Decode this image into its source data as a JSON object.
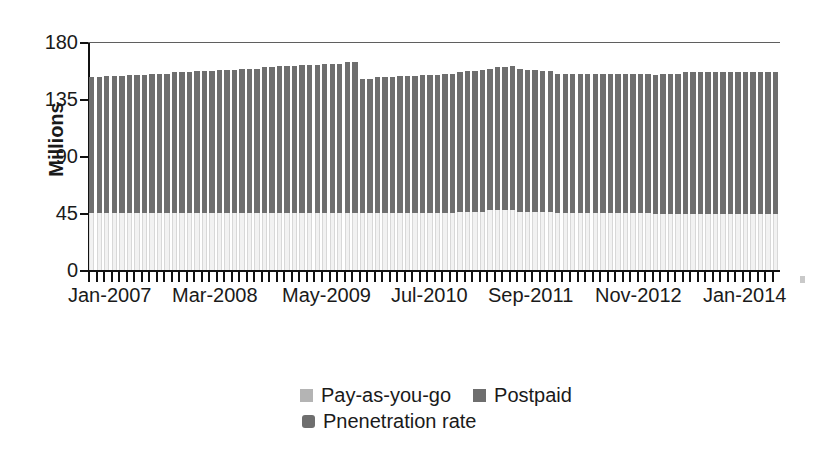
{
  "chart": {
    "type": "bar",
    "ylabel": "Millions",
    "xlabel": "",
    "title": ""
  },
  "axes": {
    "y_ticks": [
      "180",
      "135",
      "90",
      "45",
      "0"
    ],
    "x_ticks": [
      "Jan-2007",
      "Mar-2008",
      "May-2009",
      "Jul-2010",
      "Sep-2011",
      "Nov-2012",
      "Jan-2014"
    ]
  },
  "legend": {
    "items": [
      {
        "label": "Pay-as-you-go",
        "color": "#b4b4b4"
      },
      {
        "label": "Postpaid",
        "color": "#6e6e6e"
      },
      {
        "label": "Pnenetration rate",
        "color": "#6e6e6e"
      }
    ]
  },
  "colors": {
    "postpaid": "#6e6e6e",
    "payg": "#f2f2f2",
    "axis": "#111111",
    "frame": "#5f5f5f",
    "background": "#ffffff"
  },
  "chart_data": {
    "type": "bar",
    "stacked": true,
    "title": "",
    "xlabel": "",
    "ylabel": "Millions",
    "ylim": [
      0,
      180
    ],
    "yticks": [
      0,
      45,
      90,
      135,
      180
    ],
    "grid": false,
    "legend_position": "bottom",
    "categories": [
      "Jan-2007",
      "Feb-2007",
      "Mar-2007",
      "Apr-2007",
      "May-2007",
      "Jun-2007",
      "Jul-2007",
      "Aug-2007",
      "Sep-2007",
      "Oct-2007",
      "Nov-2007",
      "Dec-2007",
      "Jan-2008",
      "Feb-2008",
      "Mar-2008",
      "Apr-2008",
      "May-2008",
      "Jun-2008",
      "Jul-2008",
      "Aug-2008",
      "Sep-2008",
      "Oct-2008",
      "Nov-2008",
      "Dec-2008",
      "Jan-2009",
      "Feb-2009",
      "Mar-2009",
      "Apr-2009",
      "May-2009",
      "Jun-2009",
      "Jul-2009",
      "Aug-2009",
      "Sep-2009",
      "Oct-2009",
      "Nov-2009",
      "Dec-2009",
      "Jan-2010",
      "Feb-2010",
      "Mar-2010",
      "Apr-2010",
      "May-2010",
      "Jun-2010",
      "Jul-2010",
      "Aug-2010",
      "Sep-2010",
      "Oct-2010",
      "Nov-2010",
      "Dec-2010",
      "Jan-2011",
      "Feb-2011",
      "Mar-2011",
      "Apr-2011",
      "May-2011",
      "Jun-2011",
      "Jul-2011",
      "Aug-2011",
      "Sep-2011",
      "Oct-2011",
      "Nov-2011",
      "Dec-2011",
      "Jan-2012",
      "Feb-2012",
      "Mar-2012",
      "Apr-2012",
      "May-2012",
      "Jun-2012",
      "Jul-2012",
      "Aug-2012",
      "Sep-2012",
      "Oct-2012",
      "Nov-2012",
      "Dec-2012",
      "Jan-2013",
      "Feb-2013",
      "Mar-2013",
      "Apr-2013",
      "May-2013",
      "Jun-2013",
      "Jul-2013",
      "Aug-2013",
      "Sep-2013",
      "Oct-2013",
      "Nov-2013",
      "Dec-2013",
      "Jan-2014",
      "Feb-2014",
      "Mar-2014",
      "Apr-2014",
      "May-2014",
      "Jun-2014",
      "Jul-2014",
      "Aug-2014"
    ],
    "series": [
      {
        "name": "Pay-as-you-go",
        "color": "#f2f2f2",
        "values": [
          45,
          45,
          45,
          45,
          45,
          45,
          45,
          45,
          45,
          45,
          45,
          45,
          45,
          45,
          45,
          45,
          45,
          45,
          45,
          45,
          45,
          45,
          45,
          45,
          45,
          45,
          45,
          45,
          45,
          45,
          45,
          45,
          45,
          45,
          45,
          45,
          45,
          45,
          45,
          45,
          45,
          45,
          45,
          45,
          45,
          45,
          45,
          45,
          45,
          46,
          46,
          46,
          46,
          47,
          47,
          47,
          47,
          46,
          46,
          46,
          46,
          46,
          45,
          45,
          45,
          45,
          45,
          45,
          45,
          45,
          45,
          45,
          45,
          45,
          45,
          44,
          44,
          44,
          44,
          44,
          44,
          44,
          44,
          44,
          44,
          44,
          44,
          44,
          44,
          44,
          44,
          44
        ]
      },
      {
        "name": "Postpaid",
        "color": "#6e6e6e",
        "values": [
          107,
          107,
          108,
          108,
          108,
          109,
          109,
          109,
          110,
          110,
          110,
          111,
          111,
          111,
          112,
          112,
          112,
          113,
          113,
          113,
          114,
          114,
          114,
          115,
          115,
          116,
          116,
          116,
          117,
          117,
          117,
          118,
          118,
          118,
          119,
          119,
          106,
          106,
          107,
          107,
          107,
          108,
          108,
          108,
          109,
          109,
          109,
          110,
          110,
          110,
          111,
          111,
          112,
          112,
          113,
          113,
          114,
          113,
          112,
          112,
          111,
          111,
          110,
          110,
          110,
          110,
          110,
          110,
          110,
          110,
          110,
          110,
          110,
          110,
          110,
          110,
          111,
          111,
          111,
          112,
          112,
          112,
          112,
          112,
          112,
          112,
          112,
          112,
          112,
          112,
          112,
          112
        ]
      }
    ],
    "totals": [
      152,
      152,
      153,
      153,
      153,
      154,
      154,
      154,
      155,
      155,
      155,
      156,
      156,
      156,
      157,
      157,
      157,
      158,
      158,
      158,
      159,
      159,
      159,
      160,
      160,
      161,
      161,
      161,
      162,
      162,
      162,
      163,
      163,
      163,
      164,
      164,
      151,
      151,
      152,
      152,
      152,
      153,
      153,
      153,
      154,
      154,
      154,
      155,
      155,
      156,
      157,
      157,
      158,
      159,
      160,
      160,
      161,
      159,
      158,
      158,
      157,
      157,
      155,
      155,
      155,
      155,
      155,
      155,
      155,
      155,
      155,
      155,
      155,
      155,
      155,
      154,
      155,
      155,
      155,
      156,
      156,
      156,
      156,
      156,
      156,
      156,
      156,
      156,
      156,
      156,
      156,
      156
    ]
  }
}
